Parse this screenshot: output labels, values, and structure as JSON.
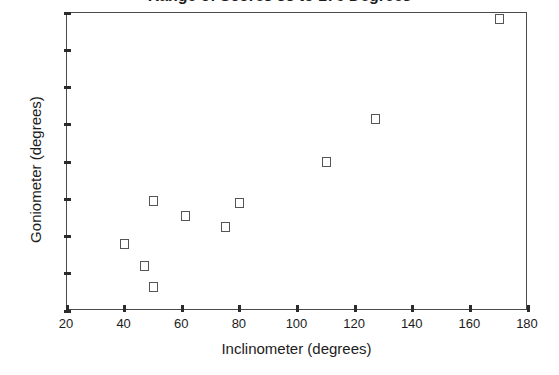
{
  "chart_data": {
    "type": "scatter",
    "title": "Range of Scores 33 to 176 Degrees",
    "xlabel": "Inclinometer (degrees)",
    "ylabel": "Goniometer (degrees)",
    "xlim": [
      20,
      180
    ],
    "ylim": [
      20,
      180
    ],
    "xticks": [
      20,
      40,
      60,
      80,
      100,
      120,
      140,
      160,
      180
    ],
    "yticks": [
      20,
      40,
      60,
      80,
      100,
      120,
      140,
      160,
      180
    ],
    "grid": false,
    "legend": null,
    "marker": "open-square",
    "marker_color": "#555555",
    "series": [
      {
        "name": "Inclinometer vs Goniometer",
        "points": [
          {
            "x": 40,
            "y": 56
          },
          {
            "x": 47,
            "y": 44
          },
          {
            "x": 50,
            "y": 33
          },
          {
            "x": 50,
            "y": 79
          },
          {
            "x": 61,
            "y": 71
          },
          {
            "x": 75,
            "y": 65
          },
          {
            "x": 80,
            "y": 78
          },
          {
            "x": 110,
            "y": 100
          },
          {
            "x": 127,
            "y": 123
          },
          {
            "x": 170,
            "y": 177
          }
        ]
      }
    ]
  },
  "axes": {
    "x_tick_labels": [
      "20",
      "40",
      "60",
      "80",
      "100",
      "120",
      "140",
      "160",
      "180"
    ],
    "y_tick_labels": [
      "20",
      "40",
      "60",
      "80",
      "100",
      "120",
      "140",
      "160",
      "180"
    ]
  }
}
